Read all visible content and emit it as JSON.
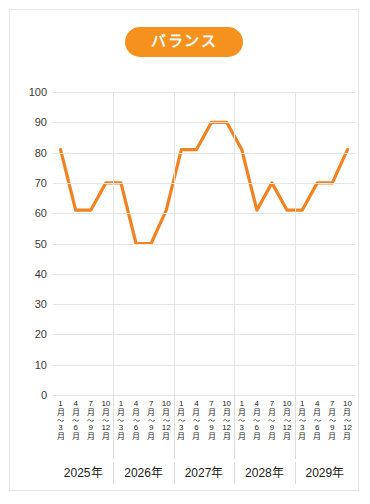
{
  "card": {
    "title": "バランス",
    "accent_color": "#f5921e",
    "line_color": "#f2821f",
    "grid_color": "#e4e4e4",
    "background_color": "#ffffff",
    "border_color": "#e6e6e6"
  },
  "chart_data": {
    "type": "line",
    "title": "バランス",
    "xlabel": "",
    "ylabel": "",
    "ylim": [
      0,
      100
    ],
    "ytick_step": 10,
    "yticks": [
      "100",
      "90",
      "80",
      "70",
      "60",
      "50",
      "40",
      "30",
      "20",
      "10",
      "0"
    ],
    "grid": true,
    "legend": "none",
    "year_groups": [
      "2025年",
      "2026年",
      "2027年",
      "2028年",
      "2029年"
    ],
    "quarter_labels": [
      {
        "start_num": "1",
        "start_unit": "月",
        "tilde": "〜",
        "end_num": "3",
        "end_unit": "月"
      },
      {
        "start_num": "4",
        "start_unit": "月",
        "tilde": "〜",
        "end_num": "6",
        "end_unit": "月"
      },
      {
        "start_num": "7",
        "start_unit": "月",
        "tilde": "〜",
        "end_num": "9",
        "end_unit": "月"
      },
      {
        "start_num": "10",
        "start_unit": "月",
        "tilde": "〜",
        "end_num": "12",
        "end_unit": "月"
      }
    ],
    "categories": [
      "2025年 1月〜3月",
      "2025年 4月〜6月",
      "2025年 7月〜9月",
      "2025年 10月〜12月",
      "2026年 1月〜3月",
      "2026年 4月〜6月",
      "2026年 7月〜9月",
      "2026年 10月〜12月",
      "2027年 1月〜3月",
      "2027年 4月〜6月",
      "2027年 7月〜9月",
      "2027年 10月〜12月",
      "2028年 1月〜3月",
      "2028年 4月〜6月",
      "2028年 7月〜9月",
      "2028年 10月〜12月",
      "2029年 1月〜3月",
      "2029年 4月〜6月",
      "2029年 7月〜9月",
      "2029年 10月〜12月"
    ],
    "values": [
      81,
      61,
      61,
      70,
      70,
      50,
      50,
      61,
      81,
      81,
      90,
      90,
      81,
      61,
      70,
      61,
      61,
      70,
      70,
      81
    ]
  }
}
